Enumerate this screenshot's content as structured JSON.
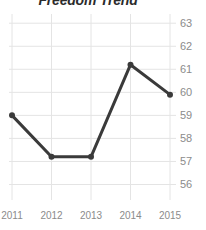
{
  "chart_data": {
    "type": "line",
    "title": "Freedom Trend",
    "xlabel": "",
    "ylabel": "",
    "categories": [
      "2011",
      "2012",
      "2013",
      "2014",
      "2015"
    ],
    "x": [
      2011,
      2012,
      2013,
      2014,
      2015
    ],
    "values": [
      59.0,
      57.2,
      57.2,
      61.2,
      59.9
    ],
    "series": [
      {
        "name": "Freedom",
        "values": [
          59.0,
          57.2,
          57.2,
          61.2,
          59.9
        ]
      }
    ],
    "yticks": [
      63,
      62,
      61,
      60,
      59,
      58,
      57,
      56
    ],
    "ytick_labels": [
      "63",
      "62",
      "61",
      "60",
      "59",
      "58",
      "57",
      "56"
    ],
    "xtick_labels": [
      "2011",
      "2012",
      "2013",
      "2014",
      "2015"
    ],
    "ylim": [
      55.5,
      63.4
    ],
    "xlim": [
      2010.95,
      2015.05
    ],
    "grid": true,
    "grid_axis": "both",
    "legend": false,
    "legend_position": "none",
    "line_color": "#3a3a3a",
    "marker": "circle",
    "marker_color": "#3a3a3a",
    "grid_color": "#e4e4e4",
    "tick_label_color": "#8b8b8b",
    "title_color": "#2b2b2b",
    "background_color": "#ffffff",
    "ytick_side": "right"
  }
}
